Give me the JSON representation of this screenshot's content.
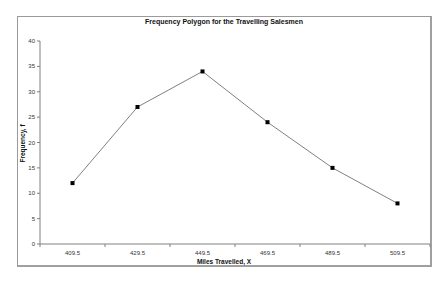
{
  "chart_data": {
    "type": "line",
    "title": "Frequency Polygon for the Travelling Salesmen",
    "xlabel": "Miles Travelled, X",
    "ylabel": "Frequency, f",
    "categories": [
      "409.5",
      "429.5",
      "449.5",
      "469.5",
      "489.5",
      "509.5"
    ],
    "series": [
      {
        "name": "Frequency",
        "values": [
          12,
          27,
          34,
          24,
          15,
          8
        ]
      }
    ],
    "ylim": [
      0,
      40
    ],
    "yticks": [
      0,
      5,
      10,
      15,
      20,
      25,
      30,
      35,
      40
    ],
    "grid": false,
    "legend": "none",
    "colors": {
      "line": "#808080",
      "marker": "#000000"
    }
  }
}
